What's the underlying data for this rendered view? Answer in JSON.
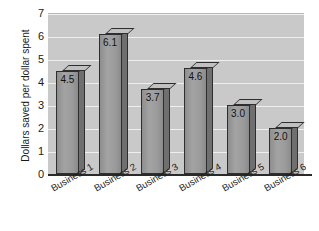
{
  "chart_data": {
    "type": "bar",
    "title": "",
    "xlabel": "",
    "ylabel": "Dollars saved per dollar spent",
    "categories": [
      "Business 1",
      "Business 2",
      "Business 3",
      "Business 4",
      "Business 5",
      "Business 6"
    ],
    "values": [
      4.5,
      6.1,
      3.7,
      4.6,
      3.0,
      2.0
    ],
    "value_labels": [
      "4.5",
      "6.1",
      "3.7",
      "4.6",
      "3.0",
      "2.0"
    ],
    "ylim": [
      0,
      7
    ],
    "yticks": [
      0,
      1,
      2,
      3,
      4,
      5,
      6,
      7
    ],
    "ytick_labels": [
      "0",
      "1",
      "2",
      "3",
      "4",
      "5",
      "6",
      "7"
    ],
    "grid": true,
    "grid_axis": "y",
    "legend": false,
    "legend_position": "none",
    "xtick_rotation": -30,
    "colors": {
      "plot_background": "#c9c9c9",
      "figure_background": "#ffffff",
      "bar_front": "#9a9a9a",
      "bar_top": "#c0c0c0",
      "bar_side": "#6f6f6f",
      "bar_outline": "#2e2e2e",
      "gridline": "#efefef",
      "axis_line": "#2a2a2a",
      "text": "#1a1a1a"
    }
  }
}
